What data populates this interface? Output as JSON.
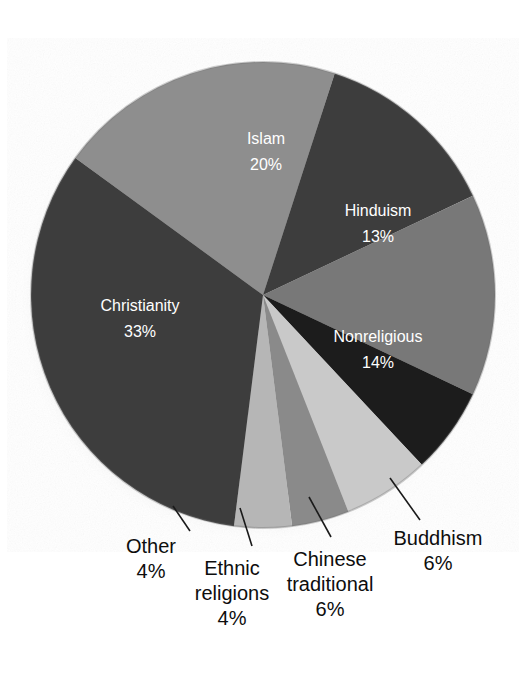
{
  "chart_data": {
    "type": "pie",
    "title": "",
    "subtitle": "",
    "xlabel": "",
    "ylabel": "",
    "legend_position": "none",
    "grid": false,
    "units": "percent",
    "total": 100,
    "categories": [
      "Islam",
      "Hinduism",
      "Nonreligious",
      "Buddhism",
      "Chinese traditional",
      "Ethnic religions",
      "Other",
      "Christianity"
    ],
    "values": [
      20,
      13,
      14,
      6,
      6,
      4,
      4,
      33
    ],
    "slices": [
      {
        "id": "islam",
        "name": "Islam",
        "value": 20,
        "value_text": "20%",
        "color": "#8e8e8e",
        "label_placement": "inside",
        "label_color": "#ffffff",
        "start_angle": -54,
        "end_angle": 18,
        "label_x": 266,
        "label_y": 140,
        "line1": "Islam",
        "line2": "20%"
      },
      {
        "id": "hinduism",
        "name": "Hinduism",
        "value": 13,
        "value_text": "13%",
        "color": "#3d3d3d",
        "label_placement": "inside",
        "label_color": "#ffffff",
        "start_angle": 18,
        "end_angle": 64.8,
        "label_x": 378,
        "label_y": 212,
        "line1": "Hinduism",
        "line2": "13%"
      },
      {
        "id": "nonreligious",
        "name": "Nonreligious",
        "value": 14,
        "value_text": "14%",
        "color": "#787878",
        "label_placement": "inside",
        "label_color": "#ffffff",
        "start_angle": 64.8,
        "end_angle": 115.2,
        "label_x": 378,
        "label_y": 338,
        "line1": "Nonreligious",
        "line2": "14%"
      },
      {
        "id": "buddhism",
        "name": "Buddhism",
        "value": 6,
        "value_text": "6%",
        "color": "#1c1c1c",
        "label_placement": "outside",
        "label_color": "#0d0d0d",
        "start_angle": 115.2,
        "end_angle": 136.8,
        "label_x": 438,
        "label_y": 545,
        "line1": "Buddhism",
        "line2": "6%",
        "leader_x1": 390,
        "leader_y1": 478,
        "leader_x2": 420,
        "leader_y2": 520
      },
      {
        "id": "chinese-traditional",
        "name": "Chinese traditional",
        "value": 6,
        "value_text": "6%",
        "color": "#c9c9c9",
        "label_placement": "outside",
        "label_color": "#0d0d0d",
        "start_angle": 136.8,
        "end_angle": 158.4,
        "label_x": 330,
        "label_y": 566,
        "line1": "Chinese",
        "line2": "traditional",
        "line3": "6%",
        "leader_x1": 309,
        "leader_y1": 497,
        "leader_x2": 331,
        "leader_y2": 537
      },
      {
        "id": "ethnic-religions",
        "name": "Ethnic religions",
        "value": 4,
        "value_text": "4%",
        "color": "#8a8a8a",
        "label_placement": "outside",
        "label_color": "#0d0d0d",
        "start_angle": 158.4,
        "end_angle": 172.8,
        "label_x": 232,
        "label_y": 575,
        "line1": "Ethnic",
        "line2": "religions",
        "line3": "4%",
        "leader_x1": 240,
        "leader_y1": 508,
        "leader_x2": 252,
        "leader_y2": 546
      },
      {
        "id": "other",
        "name": "Other",
        "value": 4,
        "value_text": "4%",
        "color": "#b6b6b6",
        "label_placement": "outside",
        "label_color": "#0d0d0d",
        "start_angle": 172.8,
        "end_angle": 187.2,
        "label_x": 151,
        "label_y": 553,
        "leader_x1": 173,
        "leader_y1": 506,
        "leader_x2": 190,
        "leader_y2": 531,
        "line1": "Other",
        "line2": "4%"
      },
      {
        "id": "christianity",
        "name": "Christianity",
        "value": 33,
        "value_text": "33%",
        "color": "#3c3c3c",
        "label_placement": "inside",
        "label_color": "#ffffff",
        "start_angle": 187.2,
        "end_angle": 306,
        "label_x": 140,
        "label_y": 307,
        "line1": "Christianity",
        "line2": "33%"
      }
    ],
    "geometry": {
      "center_x": 263,
      "center_y": 295,
      "radius_x": 232,
      "radius_y": 233,
      "rotation_offset_deg": -54
    },
    "colors": {
      "background": "#ffffff",
      "label_inside": "#ffffff",
      "label_outside": "#0d0d0d",
      "leader_line": "#1a1a1a",
      "shadow": "#b9b9b9"
    }
  }
}
